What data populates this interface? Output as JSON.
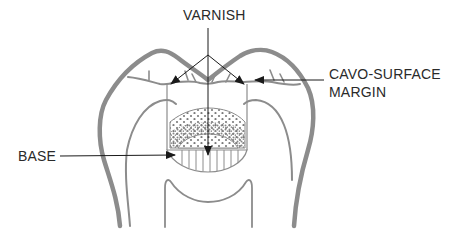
{
  "figure": {
    "type": "dental cross-section diagram",
    "colors": {
      "background": "#ffffff",
      "tooth_outline": "#8c8c8c",
      "leader_lines": "#1a1a1a",
      "text": "#2a2a2a",
      "restoration_dots": "#7a7a7a"
    }
  },
  "labels": {
    "varnish": "VARNISH",
    "cavo_surface_line1": "CAVO-SURFACE",
    "cavo_surface_line2": "MARGIN",
    "base": "BASE"
  },
  "annotations": [
    {
      "label": "VARNISH",
      "pointers": 3,
      "targets": [
        "left cavity wall margin",
        "right cavity wall margin",
        "cavity floor"
      ]
    },
    {
      "label": "CAVO-SURFACE MARGIN",
      "pointers": 1,
      "target": "right cavo-surface margin"
    },
    {
      "label": "BASE",
      "pointers": 1,
      "target": "base layer beneath restoration"
    }
  ]
}
